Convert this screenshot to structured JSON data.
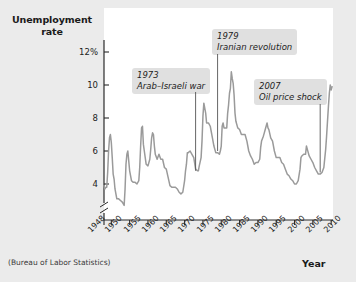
{
  "figure": {
    "y_axis_title_line1": "Unemployment",
    "y_axis_title_line2": "rate",
    "x_axis_title": "Year",
    "source_note": "(Bureau of Labor Statistics)"
  },
  "annotations": [
    {
      "id": "annot-1973",
      "year_label": "1973",
      "event_label": "Arab–Israeli war"
    },
    {
      "id": "annot-1979",
      "year_label": "1979",
      "event_label": "Iranian revolution"
    },
    {
      "id": "annot-2007",
      "year_label": "2007",
      "event_label": "Oil price shock"
    }
  ],
  "chart_data": {
    "type": "line",
    "title": "",
    "xlabel": "Year",
    "ylabel": "Unemployment rate",
    "ylim": [
      3.0,
      12.8
    ],
    "xlim": [
      1948,
      2010.5
    ],
    "grid": false,
    "legend": null,
    "y_axis_break": true,
    "y_axis_break_below": 3.6,
    "yticks": [
      4,
      6,
      8,
      10,
      12
    ],
    "ytick_labels": [
      "4",
      "6",
      "8",
      "10",
      "12%"
    ],
    "xticks": [
      1948,
      1950,
      1955,
      1960,
      1965,
      1970,
      1975,
      1980,
      1985,
      1990,
      1995,
      2000,
      2005,
      2010
    ],
    "xtick_labels": [
      "1948",
      "1950",
      "1955",
      "1960",
      "1965",
      "1970",
      "1975",
      "1980",
      "1985",
      "1990",
      "1995",
      "2000",
      "2005",
      "2010"
    ],
    "series_color": "#9a9a9a",
    "series": [
      {
        "name": "Unemployment rate",
        "x": [
          1948.0,
          1948.25,
          1948.5,
          1948.75,
          1949.0,
          1949.25,
          1949.5,
          1949.75,
          1950.0,
          1950.25,
          1950.5,
          1950.75,
          1951.0,
          1951.5,
          1952.0,
          1952.5,
          1953.0,
          1953.5,
          1953.75,
          1954.0,
          1954.25,
          1954.5,
          1954.75,
          1955.0,
          1955.5,
          1956.0,
          1956.5,
          1957.0,
          1957.5,
          1957.75,
          1958.0,
          1958.25,
          1958.5,
          1958.75,
          1959.0,
          1959.5,
          1960.0,
          1960.5,
          1960.75,
          1961.0,
          1961.25,
          1961.5,
          1961.75,
          1962.0,
          1962.5,
          1963.0,
          1963.5,
          1964.0,
          1964.5,
          1965.0,
          1965.5,
          1966.0,
          1966.5,
          1967.0,
          1967.5,
          1968.0,
          1968.5,
          1969.0,
          1969.5,
          1970.0,
          1970.25,
          1970.5,
          1970.75,
          1971.0,
          1971.5,
          1972.0,
          1972.5,
          1973.0,
          1973.5,
          1973.75,
          1974.0,
          1974.5,
          1974.75,
          1975.0,
          1975.25,
          1975.5,
          1975.75,
          1976.0,
          1976.5,
          1977.0,
          1977.5,
          1978.0,
          1978.5,
          1979.0,
          1979.5,
          1979.75,
          1980.0,
          1980.25,
          1980.5,
          1980.75,
          1981.0,
          1981.5,
          1981.75,
          1982.0,
          1982.25,
          1982.5,
          1982.75,
          1983.0,
          1983.25,
          1983.5,
          1983.75,
          1984.0,
          1984.5,
          1985.0,
          1985.5,
          1986.0,
          1986.5,
          1987.0,
          1987.5,
          1988.0,
          1988.5,
          1989.0,
          1989.5,
          1990.0,
          1990.5,
          1990.75,
          1991.0,
          1991.5,
          1991.75,
          1992.0,
          1992.5,
          1992.75,
          1993.0,
          1993.5,
          1994.0,
          1994.5,
          1995.0,
          1995.5,
          1996.0,
          1996.5,
          1997.0,
          1997.5,
          1998.0,
          1998.5,
          1999.0,
          1999.5,
          2000.0,
          2000.5,
          2001.0,
          2001.5,
          2001.75,
          2002.0,
          2002.5,
          2003.0,
          2003.25,
          2003.5,
          2004.0,
          2004.5,
          2005.0,
          2005.5,
          2006.0,
          2006.5,
          2007.0,
          2007.5,
          2008.0,
          2008.5,
          2008.75,
          2009.0,
          2009.25,
          2009.5,
          2009.75,
          2010.0,
          2010.25
        ],
        "values": [
          3.9,
          3.7,
          3.8,
          3.8,
          4.7,
          6.0,
          6.8,
          7.0,
          6.5,
          5.6,
          4.6,
          4.3,
          3.7,
          3.1,
          3.1,
          3.0,
          2.9,
          2.7,
          3.7,
          5.2,
          5.8,
          6.0,
          5.4,
          4.8,
          4.2,
          4.1,
          4.1,
          4.0,
          4.2,
          5.0,
          6.3,
          7.4,
          7.5,
          6.4,
          6.0,
          5.2,
          5.1,
          5.5,
          6.1,
          6.8,
          7.1,
          7.0,
          6.3,
          5.8,
          5.5,
          5.8,
          5.5,
          5.5,
          5.0,
          4.9,
          4.4,
          3.9,
          3.8,
          3.8,
          3.8,
          3.7,
          3.5,
          3.4,
          3.5,
          4.2,
          4.8,
          5.2,
          5.9,
          5.9,
          6.0,
          5.8,
          5.6,
          4.9,
          4.8,
          4.8,
          5.1,
          5.6,
          6.6,
          8.1,
          8.9,
          8.6,
          8.3,
          7.7,
          7.7,
          7.5,
          6.9,
          6.3,
          5.9,
          5.9,
          5.8,
          6.0,
          6.3,
          7.5,
          7.7,
          7.4,
          7.4,
          7.4,
          8.3,
          8.8,
          9.5,
          9.8,
          10.8,
          10.4,
          10.1,
          9.4,
          8.3,
          7.8,
          7.4,
          7.3,
          7.0,
          7.0,
          7.0,
          6.6,
          6.0,
          5.7,
          5.5,
          5.2,
          5.3,
          5.3,
          5.5,
          6.2,
          6.6,
          6.9,
          7.1,
          7.3,
          7.7,
          7.4,
          7.3,
          6.8,
          6.6,
          6.0,
          5.6,
          5.6,
          5.6,
          5.3,
          5.2,
          4.9,
          4.6,
          4.5,
          4.3,
          4.2,
          4.0,
          4.0,
          4.2,
          4.9,
          5.6,
          5.7,
          5.8,
          5.8,
          6.3,
          6.1,
          5.7,
          5.5,
          5.3,
          5.0,
          4.8,
          4.6,
          4.6,
          4.7,
          5.0,
          6.1,
          6.9,
          7.8,
          8.7,
          9.5,
          10.0,
          9.7,
          9.9
        ]
      }
    ],
    "annotations": [
      {
        "year": 1973,
        "label_line1": "1973",
        "label_line2": "Arab–Israeli war",
        "pointer_to_value": 4.8
      },
      {
        "year": 1979,
        "label_line1": "1979",
        "label_line2": "Iranian revolution",
        "pointer_to_value": 6.0
      },
      {
        "year": 2007,
        "label_line1": "2007",
        "label_line2": "Oil price shock",
        "pointer_to_value": 4.7
      }
    ]
  },
  "colors": {
    "background": "#ebebeb",
    "plot_background": "#ffffff",
    "line": "#9a9a9a",
    "axis": "#2a2a2a",
    "annotation_box": "#e0e0e0",
    "text": "#1a1a1a"
  }
}
